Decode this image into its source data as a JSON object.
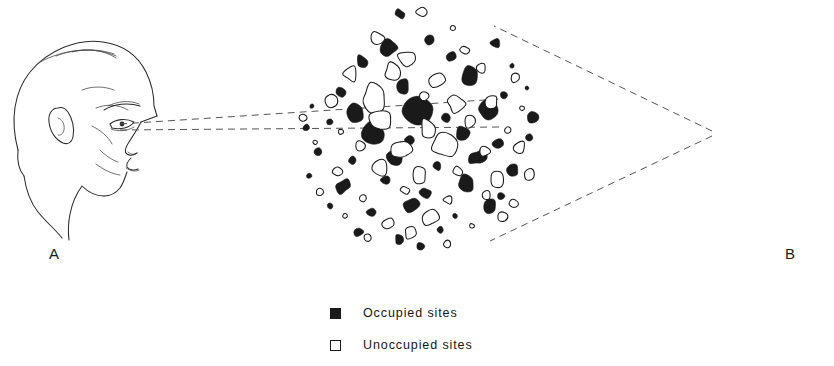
{
  "figure": {
    "background_color": "#ffffff",
    "ink_color": "#1a1a1a",
    "width": 834,
    "height": 366
  },
  "observers": [
    {
      "id": "A",
      "label": "A",
      "orientation": "facing-right",
      "eye_point": [
        118,
        127
      ],
      "sightline_style": "dashed",
      "sightline_count": 2,
      "sightline_spread": "narrow"
    },
    {
      "id": "B",
      "label": "B",
      "orientation": "facing-left",
      "eye_point": [
        714,
        133
      ],
      "sightline_style": "dashed",
      "sightline_count": 2,
      "sightline_spread": "wide"
    }
  ],
  "sightlines": [
    {
      "from": "A",
      "x1": 118,
      "y1": 125,
      "x2": 497,
      "y2": 100
    },
    {
      "from": "A",
      "x1": 118,
      "y1": 130,
      "x2": 497,
      "y2": 128
    },
    {
      "from": "B",
      "x1": 714,
      "y1": 132,
      "x2": 496,
      "y2": 27
    },
    {
      "from": "B",
      "x1": 714,
      "y1": 135,
      "x2": 492,
      "y2": 240
    }
  ],
  "cluster": {
    "name": "site-cluster",
    "center": [
      418,
      131
    ],
    "radius_x": 120,
    "radius_y": 124,
    "description": "Circular field of irregular blob-shaped sites",
    "occupied_color": "#1a1a1a",
    "unoccupied_color": "#ffffff",
    "outline_color": "#1a1a1a"
  },
  "legend": {
    "items": [
      {
        "marker": "filled-square",
        "label": "Occupied sites"
      },
      {
        "marker": "open-square",
        "label": "Unoccupied sites"
      }
    ]
  },
  "chart_data": {
    "type": "scatter",
    "title": "",
    "xlabel": "",
    "ylabel": "",
    "legend_position": "bottom-center",
    "grid": false,
    "categories": [
      "Occupied sites",
      "Unoccupied sites"
    ],
    "series": [
      {
        "name": "Occupied sites",
        "marker": "filled-blob",
        "points": [
          [
            400,
            14
          ],
          [
            482,
            18
          ],
          [
            523,
            22
          ],
          [
            346,
            31
          ],
          [
            430,
            40
          ],
          [
            389,
            48
          ],
          [
            496,
            43
          ],
          [
            318,
            58
          ],
          [
            362,
            62
          ],
          [
            451,
            57
          ],
          [
            512,
            66
          ],
          [
            535,
            52
          ],
          [
            301,
            80
          ],
          [
            340,
            92
          ],
          [
            403,
            86
          ],
          [
            470,
            78
          ],
          [
            504,
            95
          ],
          [
            527,
            88
          ],
          [
            312,
            106
          ],
          [
            357,
            112
          ],
          [
            418,
            108
          ],
          [
            446,
            118
          ],
          [
            489,
            112
          ],
          [
            533,
            116
          ],
          [
            306,
            128
          ],
          [
            330,
            122
          ],
          [
            374,
            134
          ],
          [
            410,
            140
          ],
          [
            462,
            132
          ],
          [
            498,
            144
          ],
          [
            529,
            138
          ],
          [
            318,
            152
          ],
          [
            352,
            160
          ],
          [
            395,
            156
          ],
          [
            437,
            166
          ],
          [
            478,
            158
          ],
          [
            513,
            170
          ],
          [
            537,
            162
          ],
          [
            309,
            176
          ],
          [
            344,
            186
          ],
          [
            386,
            180
          ],
          [
            425,
            192
          ],
          [
            466,
            184
          ],
          [
            501,
            196
          ],
          [
            526,
            188
          ],
          [
            330,
            206
          ],
          [
            371,
            212
          ],
          [
            412,
            204
          ],
          [
            455,
            216
          ],
          [
            490,
            208
          ],
          [
            518,
            220
          ],
          [
            358,
            232
          ],
          [
            399,
            240
          ],
          [
            440,
            230
          ],
          [
            475,
            242
          ],
          [
            505,
            234
          ],
          [
            382,
            250
          ],
          [
            421,
            246
          ],
          [
            460,
            252
          ]
        ],
        "count": 59
      },
      {
        "name": "Unoccupied sites",
        "marker": "open-blob",
        "points": [
          [
            368,
            16
          ],
          [
            421,
            12
          ],
          [
            453,
            28
          ],
          [
            503,
            30
          ],
          [
            325,
            42
          ],
          [
            377,
            38
          ],
          [
            408,
            60
          ],
          [
            465,
            50
          ],
          [
            520,
            40
          ],
          [
            308,
            66
          ],
          [
            350,
            74
          ],
          [
            392,
            72
          ],
          [
            437,
            80
          ],
          [
            482,
            68
          ],
          [
            516,
            78
          ],
          [
            298,
            94
          ],
          [
            332,
            100
          ],
          [
            374,
            98
          ],
          [
            424,
            96
          ],
          [
            456,
            104
          ],
          [
            492,
            102
          ],
          [
            522,
            108
          ],
          [
            303,
            118
          ],
          [
            341,
            132
          ],
          [
            382,
            120
          ],
          [
            428,
            128
          ],
          [
            470,
            122
          ],
          [
            508,
            130
          ],
          [
            315,
            142
          ],
          [
            360,
            146
          ],
          [
            401,
            150
          ],
          [
            443,
            144
          ],
          [
            484,
            152
          ],
          [
            520,
            148
          ],
          [
            300,
            164
          ],
          [
            338,
            172
          ],
          [
            380,
            168
          ],
          [
            420,
            176
          ],
          [
            459,
            172
          ],
          [
            497,
            180
          ],
          [
            529,
            174
          ],
          [
            320,
            192
          ],
          [
            363,
            198
          ],
          [
            405,
            190
          ],
          [
            448,
            200
          ],
          [
            486,
            194
          ],
          [
            514,
            204
          ],
          [
            345,
            216
          ],
          [
            388,
            224
          ],
          [
            430,
            218
          ],
          [
            472,
            226
          ],
          [
            502,
            216
          ],
          [
            368,
            238
          ],
          [
            410,
            234
          ],
          [
            447,
            244
          ],
          [
            485,
            236
          ],
          [
            396,
            254
          ],
          [
            434,
            256
          ],
          [
            463,
            248
          ]
        ],
        "count": 59
      }
    ]
  }
}
